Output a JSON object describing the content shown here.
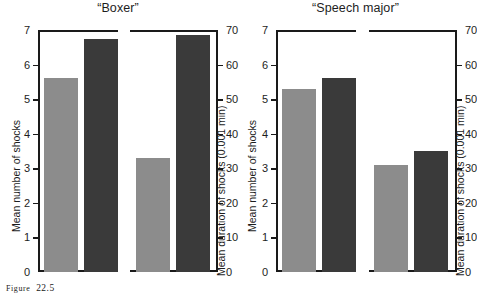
{
  "caption": {
    "label": "FIGURE",
    "number": "22.5",
    "label_display": "Figure",
    "full": "Figure 22.5"
  },
  "axes": {
    "left": {
      "title": "Mean number of shocks",
      "min": 0,
      "max": 7,
      "ticks": [
        0,
        1,
        2,
        3,
        4,
        5,
        6,
        7
      ],
      "tick_labels": [
        "0",
        "1",
        "2",
        "3",
        "4",
        "5",
        "6",
        "7"
      ]
    },
    "right": {
      "title": "Mean duration of shocks (0.001 min)",
      "min": 0,
      "max": 70,
      "ticks": [
        0,
        10,
        20,
        30,
        40,
        50,
        60,
        70
      ],
      "tick_labels": [
        "0",
        "10",
        "20",
        "30",
        "40",
        "50",
        "60",
        "70"
      ]
    }
  },
  "colors": {
    "light_bar": "#8c8c8c",
    "dark_bar": "#3a3a3a",
    "axis": "#1a1a1a",
    "background": "#ffffff"
  },
  "chart_data": {
    "type": "bar",
    "title": "",
    "xlabel": "",
    "ylabel": "Mean number of shocks",
    "y2label": "Mean duration of shocks (0.001 min)",
    "ylim": [
      0,
      7
    ],
    "y2lim": [
      0,
      70
    ],
    "grid": false,
    "legend": "none",
    "panels": [
      {
        "title": "“Boxer”",
        "subplots": [
          {
            "measure": "Mean number of shocks",
            "axis": "left",
            "ylim": [
              0,
              7
            ],
            "bars": [
              {
                "series": "light",
                "color": "#8c8c8c",
                "value": 5.6
              },
              {
                "series": "dark",
                "color": "#3a3a3a",
                "value": 6.75
              }
            ]
          },
          {
            "measure": "Mean duration of shocks (0.001 min)",
            "axis": "right",
            "ylim": [
              0,
              70
            ],
            "bars": [
              {
                "series": "light",
                "color": "#8c8c8c",
                "value": 33
              },
              {
                "series": "dark",
                "color": "#3a3a3a",
                "value": 68.5
              }
            ]
          }
        ]
      },
      {
        "title": "“Speech major”",
        "subplots": [
          {
            "measure": "Mean number of shocks",
            "axis": "left",
            "ylim": [
              0,
              7
            ],
            "bars": [
              {
                "series": "light",
                "color": "#8c8c8c",
                "value": 5.3
              },
              {
                "series": "dark",
                "color": "#3a3a3a",
                "value": 5.6
              }
            ]
          },
          {
            "measure": "Mean duration of shocks (0.001 min)",
            "axis": "right",
            "ylim": [
              0,
              70
            ],
            "bars": [
              {
                "series": "light",
                "color": "#8c8c8c",
                "value": 31
              },
              {
                "series": "dark",
                "color": "#3a3a3a",
                "value": 35
              }
            ]
          }
        ]
      }
    ]
  }
}
